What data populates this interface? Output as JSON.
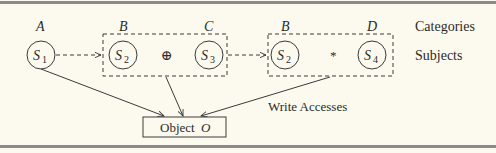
{
  "diagram": {
    "row_labels": {
      "categories": "Categories",
      "subjects": "Subjects"
    },
    "nodes": [
      {
        "id": "s1",
        "category": "A",
        "subject": "S",
        "sub": "1"
      },
      {
        "id": "s2a",
        "category": "B",
        "subject": "S",
        "sub": "2"
      },
      {
        "id": "s3",
        "category": "C",
        "subject": "S",
        "sub": "3"
      },
      {
        "id": "s2b",
        "category": "B",
        "subject": "S",
        "sub": "2"
      },
      {
        "id": "s4",
        "category": "D",
        "subject": "S",
        "sub": "4"
      }
    ],
    "groups": [
      {
        "id": "group1",
        "operator": "⊕",
        "members": [
          "s2a",
          "s3"
        ]
      },
      {
        "id": "group2",
        "operator": "*",
        "members": [
          "s2b",
          "s4"
        ]
      }
    ],
    "object": {
      "label": "Object",
      "symbol": "O"
    },
    "edge_label": "Write Accesses",
    "colors": {
      "background": "#fcfaee",
      "stroke": "#3a3a3a",
      "rule": "#8a8a86"
    }
  }
}
